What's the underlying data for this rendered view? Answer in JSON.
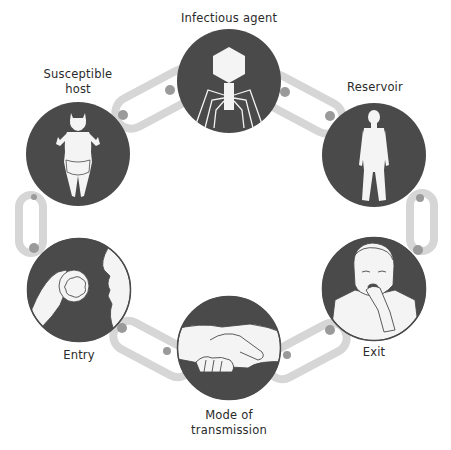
{
  "diagram": {
    "colors": {
      "circle_fill": "#4a4a4a",
      "figure_fill": "#f4f4f4",
      "link_color": "#d6d6d6",
      "link_joint": "#9a9a9a",
      "label_color": "#2a2a2a"
    },
    "nodes": [
      {
        "id": "infectious-agent",
        "label": "Infectious agent",
        "icon": "bacteriophage-icon",
        "cx": 229,
        "cy": 81,
        "r": 52
      },
      {
        "id": "reservoir",
        "label": "Reservoir",
        "icon": "human-figure-icon",
        "cx": 374,
        "cy": 155,
        "r": 52
      },
      {
        "id": "exit",
        "label": "Exit",
        "icon": "coughing-person-icon",
        "cx": 374,
        "cy": 289,
        "r": 52
      },
      {
        "id": "mode-of-transmission",
        "label": "Mode of\ntransmission",
        "icon": "handshake-icon",
        "cx": 229,
        "cy": 348,
        "r": 52
      },
      {
        "id": "entry",
        "label": "Entry",
        "icon": "eating-apple-icon",
        "cx": 79,
        "cy": 290,
        "r": 52
      },
      {
        "id": "susceptible-host",
        "label": "Susceptible\nhost",
        "icon": "baby-icon",
        "cx": 78,
        "cy": 154,
        "r": 52
      }
    ],
    "edges": [
      {
        "from": "infectious-agent",
        "to": "reservoir"
      },
      {
        "from": "reservoir",
        "to": "exit"
      },
      {
        "from": "exit",
        "to": "mode-of-transmission"
      },
      {
        "from": "mode-of-transmission",
        "to": "entry"
      },
      {
        "from": "entry",
        "to": "susceptible-host"
      },
      {
        "from": "susceptible-host",
        "to": "infectious-agent"
      }
    ]
  },
  "labels": {
    "infectious_agent": "Infectious agent",
    "reservoir": "Reservoir",
    "exit": "Exit",
    "mode_of_transmission": "Mode of\ntransmission",
    "entry": "Entry",
    "susceptible_host": "Susceptible\nhost"
  }
}
